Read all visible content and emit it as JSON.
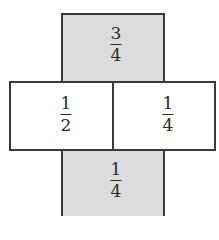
{
  "net": {
    "faces": [
      {
        "id": "top",
        "numerator": "3",
        "denominator": "4",
        "shaded": true
      },
      {
        "id": "middle-left",
        "numerator": "1",
        "denominator": "2",
        "shaded": false
      },
      {
        "id": "middle-right",
        "numerator": "1",
        "denominator": "4",
        "shaded": false
      },
      {
        "id": "bottom",
        "numerator": "1",
        "denominator": "4",
        "shaded": true
      }
    ]
  },
  "colors": {
    "shaded": "#dcdcdc",
    "border": "#3a3a3a"
  }
}
